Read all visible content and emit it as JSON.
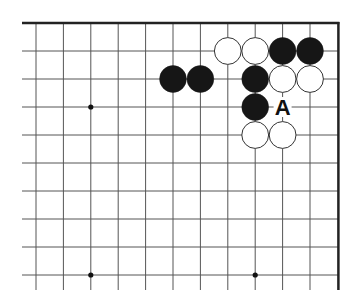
{
  "diagram": {
    "type": "go-board-fragment",
    "grid": {
      "origin_x": 36,
      "origin_y": 23,
      "spacing_x": 27.4,
      "spacing_y": 28,
      "columns": 12,
      "rows": 10,
      "extend_bottom": 15,
      "top_edge": true,
      "right_edge": true,
      "line_color": "#555555",
      "edge_color": "#222222"
    },
    "star_points": [
      {
        "col": 2,
        "row": 3
      },
      {
        "col": 2,
        "row": 9
      },
      {
        "col": 8,
        "row": 9
      }
    ],
    "stones": [
      {
        "color": "white",
        "col": 7,
        "row": 1
      },
      {
        "color": "white",
        "col": 8,
        "row": 1
      },
      {
        "color": "black",
        "col": 9,
        "row": 1
      },
      {
        "color": "black",
        "col": 10,
        "row": 1
      },
      {
        "color": "black",
        "col": 5,
        "row": 2
      },
      {
        "color": "black",
        "col": 6,
        "row": 2
      },
      {
        "color": "black",
        "col": 8,
        "row": 2
      },
      {
        "color": "white",
        "col": 9,
        "row": 2
      },
      {
        "color": "white",
        "col": 10,
        "row": 2
      },
      {
        "color": "black",
        "col": 8,
        "row": 3
      },
      {
        "color": "white",
        "col": 8,
        "row": 4
      },
      {
        "color": "white",
        "col": 9,
        "row": 4
      }
    ],
    "markers": [
      {
        "label": "A",
        "col": 9,
        "row": 3
      }
    ]
  }
}
